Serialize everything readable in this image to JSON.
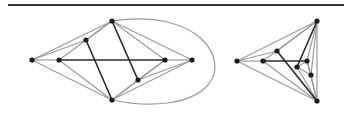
{
  "figure": {
    "width": 344,
    "height": 119,
    "top_rule": {
      "x1": 8,
      "x2": 344,
      "y": 5,
      "color": "#3a3a3a"
    },
    "colors": {
      "node": "#1e1e1e",
      "light_edge": "#9a9a9a",
      "dark_edge": "#2a2a2a"
    }
  },
  "graphs": [
    {
      "name": "left-graph",
      "nodes": {
        "A": [
          32,
          60
        ],
        "B": [
          59,
          60
        ],
        "C": [
          86,
          40
        ],
        "D": [
          112,
          21
        ],
        "E": [
          112,
          100
        ],
        "F": [
          138,
          80
        ],
        "G": [
          165,
          60
        ],
        "H": [
          192,
          60
        ]
      },
      "light_edges": [
        [
          "A",
          "D"
        ],
        [
          "A",
          "C"
        ],
        [
          "A",
          "B"
        ],
        [
          "A",
          "E"
        ],
        [
          "B",
          "D"
        ],
        [
          "B",
          "E"
        ],
        [
          "C",
          "D"
        ],
        [
          "D",
          "G"
        ],
        [
          "D",
          "H"
        ],
        [
          "E",
          "G"
        ],
        [
          "E",
          "H"
        ],
        [
          "E",
          "F"
        ],
        [
          "F",
          "G"
        ],
        [
          "F",
          "H"
        ],
        [
          "G",
          "H"
        ]
      ],
      "dark_edges": [
        [
          "B",
          "G"
        ],
        [
          "C",
          "E"
        ],
        [
          "D",
          "F"
        ]
      ],
      "curved_edges": [
        {
          "from": "D",
          "to": "E",
          "path": "M112,21 C200,8 230,60 208,85 C190,105 150,108 112,100"
        }
      ]
    },
    {
      "name": "right-graph",
      "nodes": {
        "A": [
          237,
          61
        ],
        "B": [
          263,
          61
        ],
        "C": [
          277,
          51
        ],
        "D": [
          317,
          21
        ],
        "E": [
          317,
          101
        ],
        "F": [
          297,
          67
        ],
        "G": [
          307,
          61
        ],
        "H": [
          311,
          75
        ]
      },
      "light_edges": [
        [
          "A",
          "D"
        ],
        [
          "A",
          "C"
        ],
        [
          "A",
          "B"
        ],
        [
          "A",
          "E"
        ],
        [
          "B",
          "D"
        ],
        [
          "B",
          "E"
        ],
        [
          "C",
          "D"
        ],
        [
          "D",
          "G"
        ],
        [
          "D",
          "H"
        ],
        [
          "E",
          "G"
        ],
        [
          "E",
          "H"
        ],
        [
          "E",
          "F"
        ],
        [
          "F",
          "G"
        ],
        [
          "F",
          "H"
        ],
        [
          "G",
          "H"
        ],
        [
          "D",
          "E"
        ]
      ],
      "dark_edges": [
        [
          "B",
          "G"
        ],
        [
          "C",
          "E"
        ],
        [
          "D",
          "F"
        ]
      ],
      "curved_edges": []
    }
  ]
}
